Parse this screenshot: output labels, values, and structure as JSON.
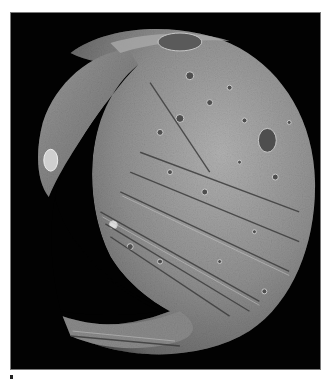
{
  "image": {
    "subject": "Cratered moon (irregular rocky body) against black space",
    "description": "Grayscale spacecraft photograph of a heavily cratered, potato-shaped moon with parallel grooves, a large crater on the upper-left rim casting a deep shadow, and the lit limb curving along the right side",
    "background_color": "#020202",
    "frame_border_color": "#7a7a7a",
    "surface_colors": {
      "highlight": "#c8c8c8",
      "midtone": "#8e8e8e",
      "shadow": "#3a3a3a"
    }
  },
  "top_text": ""
}
